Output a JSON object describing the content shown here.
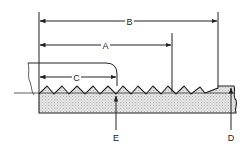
{
  "diagram": {
    "type": "thread-gauge-cross-section",
    "labels": {
      "A": "A",
      "B": "B",
      "C": "C",
      "D": "D",
      "E": "E"
    },
    "colors": {
      "line": "#222222",
      "fill": "#d9d9d9",
      "background": "#ffffff"
    }
  }
}
